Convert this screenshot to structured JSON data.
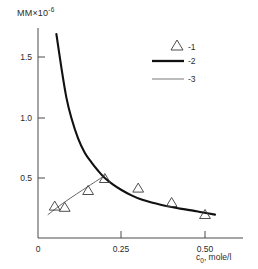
{
  "chart_data": {
    "type": "scatter",
    "title": "",
    "ylabel": "MM×10",
    "ylabel_exponent": "-6",
    "xlabel_prefix": "c",
    "xlabel_subscript": "0",
    "xlabel_suffix": ", mole/l",
    "xlabel": "c0, mole/l",
    "xlim": [
      0,
      0.56
    ],
    "ylim": [
      0,
      1.78
    ],
    "xticks": [
      0,
      0.25,
      0.5
    ],
    "xtick_labels": [
      "0",
      "0.25",
      "0.50"
    ],
    "yticks": [
      0.5,
      1.0,
      1.5
    ],
    "ytick_labels": [
      "0.5",
      "1.0",
      "1.5"
    ],
    "grid": false,
    "legend_position": "top-right",
    "series": [
      {
        "name": "-1",
        "key": "1",
        "type": "scatter",
        "marker": "triangle-up",
        "x": [
          0.05,
          0.08,
          0.15,
          0.2,
          0.3,
          0.4,
          0.5
        ],
        "y": [
          0.27,
          0.26,
          0.4,
          0.5,
          0.42,
          0.3,
          0.2
        ]
      },
      {
        "name": "-2",
        "key": "2",
        "type": "line",
        "style": "thick",
        "x": [
          0.055,
          0.07,
          0.085,
          0.1,
          0.12,
          0.14,
          0.16,
          0.18,
          0.2,
          0.225,
          0.25,
          0.28,
          0.31,
          0.34,
          0.37,
          0.4,
          0.43,
          0.46,
          0.49,
          0.53
        ],
        "y": [
          1.7,
          1.42,
          1.17,
          1.0,
          0.83,
          0.71,
          0.63,
          0.56,
          0.5,
          0.445,
          0.4,
          0.355,
          0.32,
          0.295,
          0.275,
          0.258,
          0.243,
          0.23,
          0.215,
          0.195
        ]
      },
      {
        "name": "-3",
        "key": "3",
        "type": "line",
        "style": "thin",
        "x": [
          0.03,
          0.08,
          0.15,
          0.2
        ],
        "y": [
          0.195,
          0.3,
          0.43,
          0.52
        ]
      }
    ],
    "legend": [
      {
        "label": "-1",
        "marker": "triangle-up"
      },
      {
        "label": "-2",
        "marker": "thick-line"
      },
      {
        "label": "-3",
        "marker": "thin-line"
      }
    ]
  }
}
